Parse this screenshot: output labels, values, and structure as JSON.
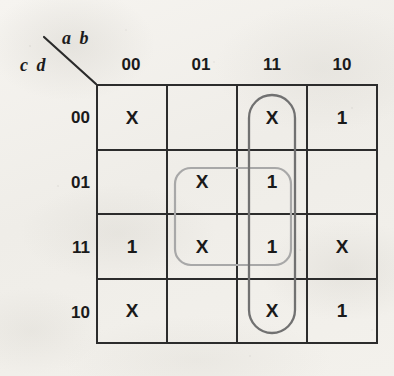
{
  "diagram": {
    "type": "karnaugh-map",
    "title": "",
    "axis_labels": {
      "columns": "a b",
      "rows": "c d"
    },
    "column_headers": [
      "00",
      "01",
      "11",
      "10"
    ],
    "row_headers": [
      "00",
      "01",
      "11",
      "10"
    ],
    "cells": [
      [
        "X",
        "",
        "X",
        "1"
      ],
      [
        "",
        "X",
        "1",
        ""
      ],
      [
        "1",
        "X",
        "1",
        "X"
      ],
      [
        "X",
        "",
        "X",
        "1"
      ]
    ],
    "groups": [
      {
        "name": "vertical-group-column-11",
        "shape": "rounded-oval",
        "columns": [
          "11"
        ],
        "rows": [
          "00",
          "01",
          "11",
          "10"
        ],
        "contents": [
          "X",
          "1",
          "1",
          "X"
        ],
        "color": "#6f6f6f"
      },
      {
        "name": "square-group-center",
        "shape": "rounded-square",
        "columns": [
          "01",
          "11"
        ],
        "rows": [
          "01",
          "11"
        ],
        "contents": [
          "X",
          "1",
          "X",
          "1"
        ],
        "color": "#a5a5a5"
      }
    ],
    "colors": {
      "grid_line": "#2c2c2c",
      "text": "#1a1a1a",
      "paper": "#f2f0ec"
    }
  }
}
